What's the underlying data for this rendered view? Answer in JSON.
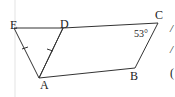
{
  "diagram": {
    "labels": {
      "E": "E",
      "D": "D",
      "C": "C",
      "B": "B",
      "A": "A"
    },
    "angle_label": "53°",
    "right_margin_glyphs": [
      "/",
      "/",
      "("
    ]
  }
}
